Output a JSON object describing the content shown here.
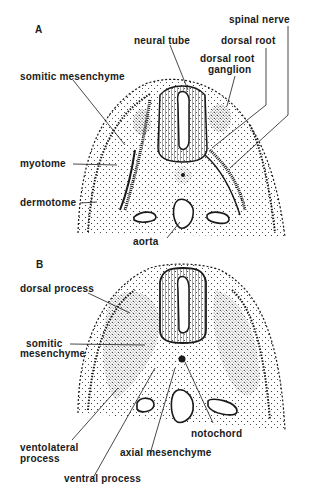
{
  "panels": [
    {
      "id": "A",
      "label": "A",
      "labels": {
        "spinal_nerve": "spinal nerve",
        "neural_tube": "neural tube",
        "dorsal_root": "dorsal root",
        "dorsal_root_ganglion_1": "dorsal root",
        "dorsal_root_ganglion_2": "ganglion",
        "somitic_mesenchyme": "somitic mesenchyme",
        "myotome": "myotome",
        "dermotome": "dermotome",
        "aorta": "aorta"
      }
    },
    {
      "id": "B",
      "label": "B",
      "labels": {
        "dorsal_process": "dorsal process",
        "somitic_mesenchyme_1": "somitic",
        "somitic_mesenchyme_2": "mesenchyme",
        "ventolateral_process_1": "ventolateral",
        "ventolateral_process_2": "process",
        "notochord": "notochord",
        "axial_mesenchyme": "axial mesenchyme",
        "ventral_process": "ventral process"
      }
    }
  ],
  "colors": {
    "ink": "#1a1a1a",
    "background": "#ffffff"
  }
}
